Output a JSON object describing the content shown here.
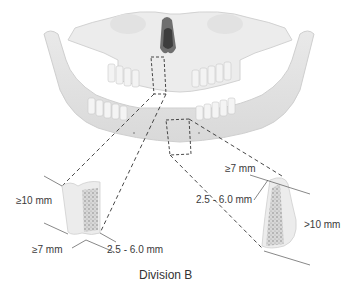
{
  "diagram": {
    "caption": "Division B",
    "left_section": {
      "height_label": "≥10 mm",
      "length_label": "≥7 mm",
      "width_label": "2.5 - 6.0 mm"
    },
    "right_section": {
      "length_label": "≥7 mm",
      "width_label": "2.5 - 6.0 mm",
      "height_label": ">10 mm"
    }
  }
}
